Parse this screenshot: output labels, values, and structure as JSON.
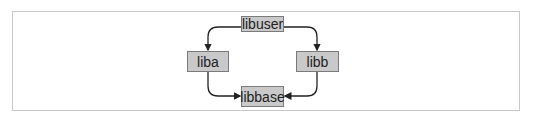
{
  "diagram": {
    "nodes": [
      {
        "id": "libuser",
        "label": "libuser"
      },
      {
        "id": "liba",
        "label": "liba"
      },
      {
        "id": "libb",
        "label": "libb"
      },
      {
        "id": "libbase",
        "label": "libbase"
      }
    ],
    "edges": [
      {
        "from": "libuser",
        "to": "liba"
      },
      {
        "from": "libuser",
        "to": "libb"
      },
      {
        "from": "liba",
        "to": "libbase"
      },
      {
        "from": "libb",
        "to": "libbase"
      }
    ],
    "colors": {
      "node_fill": "#c9c9c9",
      "node_border": "#7a7a7a",
      "edge": "#222222",
      "frame": "#c8c8c8"
    }
  }
}
